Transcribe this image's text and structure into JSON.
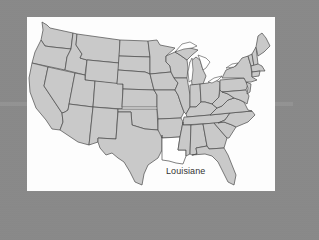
{
  "figure": {
    "type": "map",
    "highlighted_state": "Louisiana",
    "label": "Louisiane",
    "colors": {
      "background": "#8a8a8a",
      "panel": "#fdfdfd",
      "state_fill": "#c9c9c9",
      "highlight_fill": "#ffffff",
      "border": "#4a4a4a"
    }
  }
}
